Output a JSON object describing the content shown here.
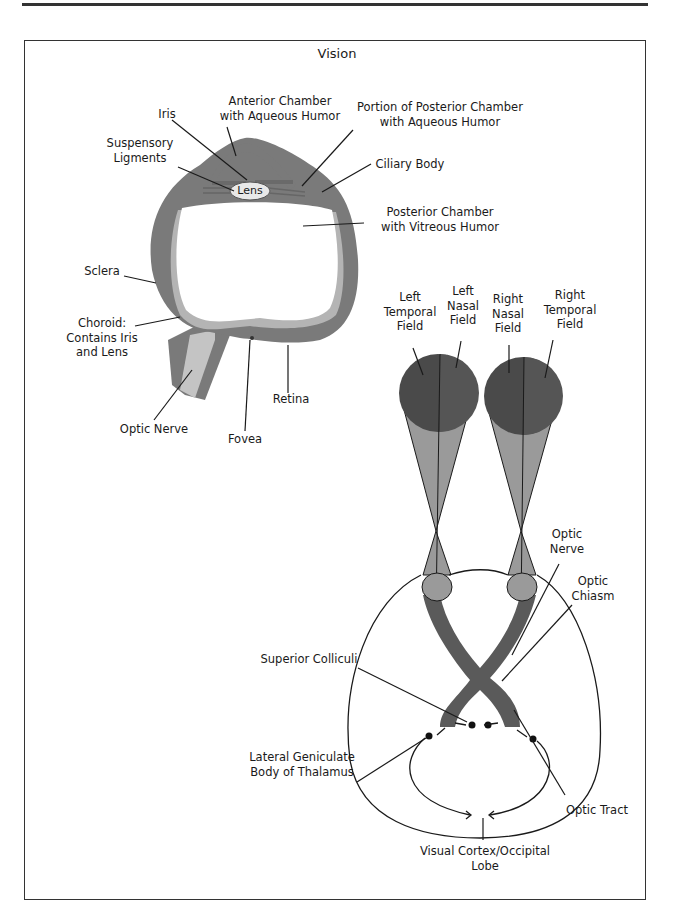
{
  "title": "Vision",
  "eye_diagram": {
    "labels": {
      "iris": "Iris",
      "anterior_chamber": [
        "Anterior Chamber",
        "with Aqueous Humor"
      ],
      "posterior_portion": [
        "Portion of Posterior Chamber",
        "with Aqueous Humor"
      ],
      "suspensory": [
        "Suspensory",
        "Ligments"
      ],
      "lens": "Lens",
      "ciliary_body": "Ciliary Body",
      "posterior_chamber": [
        "Posterior Chamber",
        "with Vitreous Humor"
      ],
      "sclera": "Sclera",
      "choroid": [
        "Choroid:",
        "Contains Iris",
        "and Lens"
      ],
      "optic_nerve": "Optic Nerve",
      "fovea": "Fovea",
      "retina": "Retina"
    }
  },
  "pathway_diagram": {
    "labels": {
      "left_temporal": [
        "Left",
        "Temporal",
        "Field"
      ],
      "left_nasal": [
        "Left",
        "Nasal",
        "Field"
      ],
      "right_nasal": [
        "Right",
        "Nasal",
        "Field"
      ],
      "right_temporal": [
        "Right",
        "Temporal",
        "Field"
      ],
      "optic_nerve": [
        "Optic",
        "Nerve"
      ],
      "optic_chiasm": [
        "Optic",
        "Chiasm"
      ],
      "superior_colliculi": "Superior Colliculi",
      "lgn": [
        "Lateral Geniculate",
        "Body of Thalamus"
      ],
      "optic_tract": "Optic Tract",
      "visual_cortex": [
        "Visual Cortex/Occipital",
        "Lobe"
      ]
    }
  },
  "colors": {
    "sclera": "#7a7a7a",
    "choroid": "#b4b4b4",
    "field_dark": "#4a4a4a",
    "field_cone": "#9a9a9a",
    "ink": "#1a1a1a"
  }
}
